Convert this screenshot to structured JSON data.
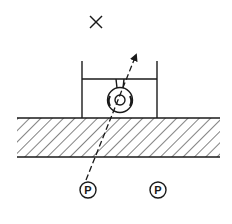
{
  "diagram": {
    "colors": {
      "stroke": "#1a1a1a",
      "background": "#ffffff"
    },
    "marker_x": {
      "icon": "x-mark-icon"
    },
    "markers": [
      {
        "label": "P"
      },
      {
        "label": "P"
      }
    ]
  }
}
